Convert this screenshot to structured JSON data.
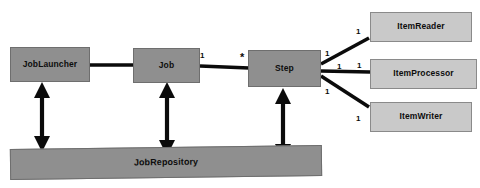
{
  "diagram": {
    "palette": {
      "core_fill": "#8f8f8f",
      "item_fill": "#c9c9c9",
      "stroke": "#0b0b0b",
      "background": "#ffffff"
    },
    "nodes": {
      "job_launcher": "JobLauncher",
      "job": "Job",
      "step": "Step",
      "job_repository": "JobRepository",
      "item_reader": "ItemReader",
      "item_processor": "ItemProcessor",
      "item_writer": "ItemWriter"
    },
    "multiplicities": {
      "job_to_step_source": "1",
      "job_to_step_target": "*",
      "step_to_reader_source": "1",
      "step_to_reader_target": "1",
      "step_to_processor_source": "1",
      "step_to_processor_target": "1",
      "step_to_writer_source": "1",
      "step_to_writer_target": "1"
    }
  }
}
